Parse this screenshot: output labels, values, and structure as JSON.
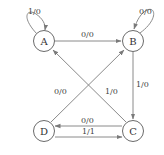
{
  "diagram": {
    "type": "state-machine",
    "states": [
      {
        "id": "A",
        "label": "A",
        "cx": 44,
        "cy": 41
      },
      {
        "id": "B",
        "label": "B",
        "cx": 133,
        "cy": 41
      },
      {
        "id": "C",
        "label": "C",
        "cx": 133,
        "cy": 131
      },
      {
        "id": "D",
        "label": "D",
        "cx": 44,
        "cy": 131
      }
    ],
    "transitions": [
      {
        "from": "A",
        "to": "A",
        "label": "1/0"
      },
      {
        "from": "A",
        "to": "B",
        "label": "0/0"
      },
      {
        "from": "B",
        "to": "B",
        "label": "0/0"
      },
      {
        "from": "B",
        "to": "C",
        "label": "1/0"
      },
      {
        "from": "C",
        "to": "A",
        "label": "1/0"
      },
      {
        "from": "D",
        "to": "B",
        "label": "0/0"
      },
      {
        "from": "C",
        "to": "D",
        "label": "0/0"
      },
      {
        "from": "D",
        "to": "C",
        "label": "1/1"
      }
    ],
    "colors": {
      "stroke": "#8a8a8a",
      "node_stroke": "#6b6b6b",
      "text": "#333333"
    }
  }
}
